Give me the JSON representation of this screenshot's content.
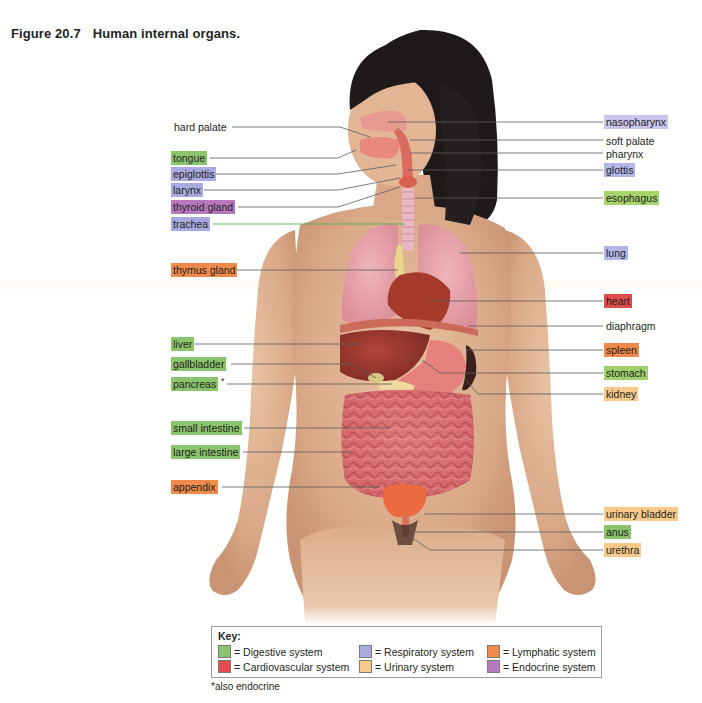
{
  "figure": {
    "number": "Figure 20.7",
    "caption": "Human internal organs."
  },
  "colors": {
    "digestive": "#8cc46e",
    "cardiovascular": "#e04b4b",
    "respiratory": "#a9abe0",
    "urinary": "#f7c98b",
    "lymphatic": "#f08a4b",
    "endocrine": "#b777bd",
    "esophagus_green": "#a6d46a",
    "none": "transparent"
  },
  "labels_left": [
    {
      "text": "hard palate",
      "system": "none",
      "x": 172,
      "y": 120
    },
    {
      "text": "tongue",
      "system": "digestive",
      "x": 171,
      "y": 151
    },
    {
      "text": "epiglottis",
      "system": "respiratory",
      "x": 171,
      "y": 167
    },
    {
      "text": "larynx",
      "system": "respiratory",
      "x": 171,
      "y": 183
    },
    {
      "text": "thyroid gland",
      "system": "endocrine",
      "x": 171,
      "y": 200
    },
    {
      "text": "trachea",
      "system": "respiratory",
      "x": 171,
      "y": 217
    },
    {
      "text": "thymus gland",
      "system": "lymphatic",
      "x": 171,
      "y": 263
    },
    {
      "text": "liver",
      "system": "digestive",
      "x": 171,
      "y": 337
    },
    {
      "text": "gallbladder",
      "system": "digestive",
      "x": 171,
      "y": 357
    },
    {
      "text": "pancreas",
      "system": "digestive",
      "x": 171,
      "y": 377,
      "suffix": "*"
    },
    {
      "text": "small intestine",
      "system": "digestive",
      "x": 171,
      "y": 421
    },
    {
      "text": "large intestine",
      "system": "digestive",
      "x": 171,
      "y": 445
    },
    {
      "text": "appendix",
      "system": "lymphatic",
      "x": 171,
      "y": 480
    }
  ],
  "labels_right": [
    {
      "text": "nasopharynx",
      "system": "respiratory",
      "x": 604,
      "y": 115
    },
    {
      "text": "soft palate",
      "system": "none",
      "x": 606,
      "y": 134
    },
    {
      "text": "pharynx",
      "system": "none",
      "x": 606,
      "y": 147
    },
    {
      "text": "glottis",
      "system": "respiratory",
      "x": 604,
      "y": 163
    },
    {
      "text": "esophagus",
      "system": "esophagus_green",
      "x": 604,
      "y": 191
    },
    {
      "text": "lung",
      "system": "respiratory",
      "x": 604,
      "y": 246
    },
    {
      "text": "heart",
      "system": "cardiovascular",
      "x": 604,
      "y": 294
    },
    {
      "text": "diaphragm",
      "system": "none",
      "x": 606,
      "y": 319
    },
    {
      "text": "spleen",
      "system": "lymphatic",
      "x": 604,
      "y": 343
    },
    {
      "text": "stomach",
      "system": "digestive",
      "x": 604,
      "y": 366
    },
    {
      "text": "kidney",
      "system": "urinary",
      "x": 604,
      "y": 387
    },
    {
      "text": "urinary bladder",
      "system": "urinary",
      "x": 604,
      "y": 507
    },
    {
      "text": "anus",
      "system": "digestive",
      "x": 604,
      "y": 525
    },
    {
      "text": "urethra",
      "system": "urinary",
      "x": 604,
      "y": 543
    }
  ],
  "key": {
    "title": "Key:",
    "items": [
      {
        "label": "= Digestive system",
        "system": "digestive",
        "x": 6,
        "y": 18
      },
      {
        "label": "= Cardiovascular system",
        "system": "cardiovascular",
        "x": 6,
        "y": 33
      },
      {
        "label": "= Respiratory system",
        "system": "respiratory",
        "x": 147,
        "y": 18
      },
      {
        "label": "= Urinary system",
        "system": "urinary",
        "x": 147,
        "y": 33
      },
      {
        "label": "= Lymphatic system",
        "system": "lymphatic",
        "x": 275,
        "y": 18
      },
      {
        "label": "= Endocrine system",
        "system": "endocrine",
        "x": 275,
        "y": 33
      }
    ]
  },
  "footnote": "*also endocrine"
}
